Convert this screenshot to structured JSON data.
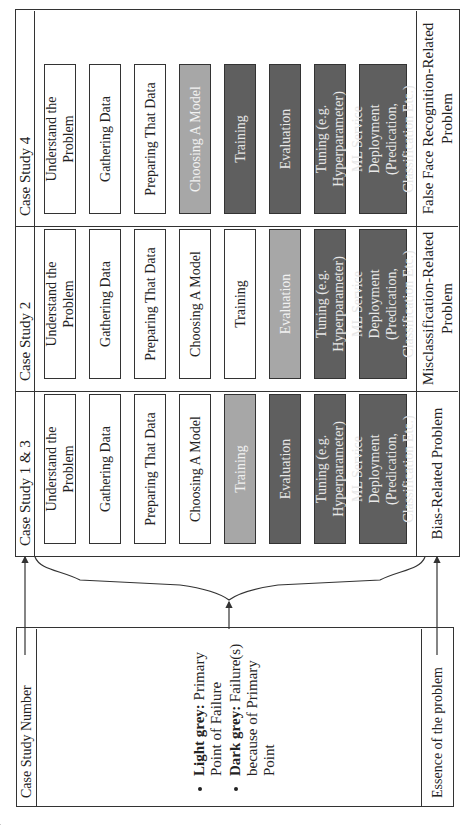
{
  "legend_box": {
    "header": "Case Study Number",
    "items": [
      {
        "term": "Light grey:",
        "text": "Primary Point of Failure"
      },
      {
        "term": "Dark grey:",
        "text": "Failure(s) because of Primary Point"
      }
    ],
    "footer": "Essence of the problem"
  },
  "colors": {
    "white": "#ffffff",
    "light_grey": "#a7a7a7",
    "dark_grey": "#5f5f5f"
  },
  "columns": [
    {
      "header": "Case Study 1 & 3",
      "steps": [
        {
          "label": "Understand the Problem",
          "shade": "white"
        },
        {
          "label": "Gathering Data",
          "shade": "white"
        },
        {
          "label": "Preparing That Data",
          "shade": "white"
        },
        {
          "label": "Choosing A Model",
          "shade": "white"
        },
        {
          "label": "Training",
          "shade": "light"
        },
        {
          "label": "Evaluation",
          "shade": "dark"
        },
        {
          "label": "Tuning (e.g. Hyperparameter)",
          "shade": "dark"
        },
        {
          "label": "ML Service Deployment (Predication, Classification Etc.)",
          "shade": "dark"
        }
      ],
      "essence": "Bias-Related Problem"
    },
    {
      "header": "Case Study 2",
      "steps": [
        {
          "label": "Understand the Problem",
          "shade": "white"
        },
        {
          "label": "Gathering Data",
          "shade": "white"
        },
        {
          "label": "Preparing That Data",
          "shade": "white"
        },
        {
          "label": "Choosing A Model",
          "shade": "white"
        },
        {
          "label": "Training",
          "shade": "white"
        },
        {
          "label": "Evaluation",
          "shade": "light"
        },
        {
          "label": "Tuning (e.g. Hyperparameter)",
          "shade": "dark"
        },
        {
          "label": "ML Service Deployment (Predication, Classification Etc.)",
          "shade": "dark"
        }
      ],
      "essence": "Misclassification-Related Problem"
    },
    {
      "header": "Case Study 4",
      "steps": [
        {
          "label": "Understand the Problem",
          "shade": "white"
        },
        {
          "label": "Gathering Data",
          "shade": "white"
        },
        {
          "label": "Preparing That Data",
          "shade": "white"
        },
        {
          "label": "Choosing A Model",
          "shade": "light"
        },
        {
          "label": "Training",
          "shade": "dark"
        },
        {
          "label": "Evaluation",
          "shade": "dark"
        },
        {
          "label": "Tuning (e.g. Hyperparameter)",
          "shade": "dark"
        },
        {
          "label": "ML Service Deployment (Predication, Classification Etc.)",
          "shade": "dark"
        }
      ],
      "essence": "False Face Recognition-Related Problem"
    }
  ]
}
